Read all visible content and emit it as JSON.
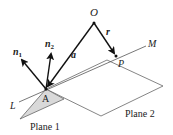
{
  "diagram": {
    "title": "",
    "points": {
      "O": {
        "label": "O",
        "x": 94,
        "y": 23
      },
      "P": {
        "label": "P",
        "x": 116,
        "y": 56
      },
      "A": {
        "label": "A",
        "x": 46,
        "y": 89
      }
    },
    "line": {
      "start_label": "L",
      "end_label": "M"
    },
    "vectors": {
      "a": {
        "label": "a",
        "from": "O",
        "to": "A"
      },
      "r": {
        "label": "r",
        "from": "O",
        "to": "P"
      },
      "n1": {
        "label": "n",
        "subscript": "1"
      },
      "n2": {
        "label": "n",
        "subscript": "2"
      }
    },
    "planes": {
      "plane1": {
        "label": "Plane 1",
        "fill": "#d9d9d9"
      },
      "plane2": {
        "label": "Plane 2",
        "fill": "#ffffff"
      }
    },
    "colors": {
      "stroke": "#555555",
      "arrow": "#111111"
    }
  }
}
